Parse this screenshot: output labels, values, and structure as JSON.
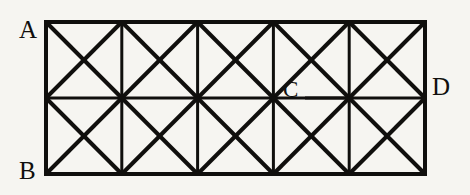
{
  "figure": {
    "kind": "geometry-diagram",
    "background_color": "#f6f5f1",
    "stroke_color": "#100f0d",
    "rectangle": {
      "left": 46,
      "top": 22,
      "right": 425,
      "bottom": 174,
      "width": 379,
      "height": 152,
      "columns": 5,
      "rows": 2,
      "cell_width": 75.8,
      "cell_height": 76
    },
    "stroke_widths": {
      "border": 4,
      "grid": 3,
      "diagonal": 4,
      "leader": 3
    },
    "grid_lines": {
      "vertical_x": [
        121.8,
        197.6,
        273.4,
        349.2
      ],
      "horizontal_y": [
        98
      ]
    },
    "leader_line": {
      "from_x": 305,
      "to_x": 349,
      "y": 98
    },
    "labels": [
      {
        "id": "A",
        "text": "A",
        "x": 19,
        "y": 17,
        "anchor": "top-left-corner"
      },
      {
        "id": "B",
        "text": "B",
        "x": 19,
        "y": 158,
        "anchor": "bottom-left-corner"
      },
      {
        "id": "C",
        "text": "C",
        "x": 283,
        "y": 78,
        "anchor": "interior-midline-vertex"
      },
      {
        "id": "D",
        "text": "D",
        "x": 432,
        "y": 74,
        "anchor": "right-edge-midline"
      }
    ]
  }
}
